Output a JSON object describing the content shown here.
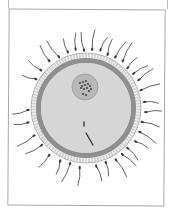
{
  "figure": {
    "title": "",
    "colors": {
      "background": "#ffffff",
      "frame": "#a8a8a8",
      "villi_layer": "#d4d4d4",
      "villi_stroke": "#8a8a8a",
      "zona_ring": "#8f8f8f",
      "cytoplasm": "#d6d6d6",
      "nucleus": "#b8b8b8",
      "nucleus_stroke": "#9a9a9a",
      "chromatin": "#4a4a4a",
      "sperm": "#3a3a3a"
    },
    "egg": {
      "cx": 86,
      "cy": 108,
      "villi_radius": 55,
      "zona_outer_radius": 50,
      "zona_inner_radius": 45
    },
    "nucleus": {
      "cx": 85,
      "cy": 87,
      "r": 13
    },
    "internal_sperm": [
      {
        "x1": 84,
        "y1": 122,
        "x2": 84,
        "y2": 126
      },
      {
        "x1": 86,
        "y1": 133,
        "x2": 93,
        "y2": 145
      }
    ],
    "sperm_count_visible": 34
  }
}
